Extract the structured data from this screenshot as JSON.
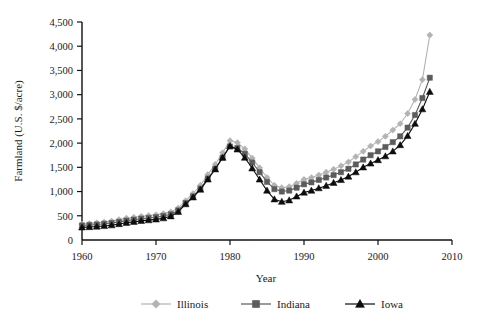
{
  "chart_data": {
    "type": "line",
    "title": "",
    "xlabel": "Year",
    "ylabel": "Farmland (U.S. $/acre)",
    "xlim": [
      1960,
      2010
    ],
    "ylim": [
      0,
      4500
    ],
    "xticks": [
      1960,
      1970,
      1980,
      1990,
      2000,
      2010
    ],
    "yticks": [
      0,
      500,
      1000,
      1500,
      2000,
      2500,
      3000,
      3500,
      4000,
      4500
    ],
    "ytick_labels": [
      "0",
      "500",
      "1,000",
      "1,500",
      "2,000",
      "2,500",
      "3,000",
      "3,500",
      "4,000",
      "4,500"
    ],
    "xtick_labels": [
      "1960",
      "1970",
      "1980",
      "1990",
      "2000",
      "2010"
    ],
    "grid": false,
    "legend_position": "bottom",
    "x": [
      1960,
      1961,
      1962,
      1963,
      1964,
      1965,
      1966,
      1967,
      1968,
      1969,
      1970,
      1971,
      1972,
      1973,
      1974,
      1975,
      1976,
      1977,
      1978,
      1979,
      1980,
      1981,
      1982,
      1983,
      1984,
      1985,
      1986,
      1987,
      1988,
      1989,
      1990,
      1991,
      1992,
      1993,
      1994,
      1995,
      1996,
      1997,
      1998,
      1999,
      2000,
      2001,
      2002,
      2003,
      2004,
      2005,
      2006,
      2007
    ],
    "series": [
      {
        "name": "Illinois",
        "color": "#b3b3b3",
        "marker": "diamond",
        "values": [
          330,
          340,
          355,
          370,
          390,
          420,
          450,
          470,
          490,
          505,
          520,
          545,
          580,
          660,
          810,
          960,
          1130,
          1350,
          1560,
          1800,
          2050,
          2010,
          1880,
          1690,
          1490,
          1290,
          1130,
          1080,
          1100,
          1170,
          1250,
          1290,
          1340,
          1400,
          1460,
          1530,
          1610,
          1720,
          1830,
          1940,
          2030,
          2140,
          2270,
          2400,
          2610,
          2900,
          3310,
          4230
        ]
      },
      {
        "name": "Indiana",
        "color": "#5c5c5c",
        "marker": "square",
        "values": [
          300,
          310,
          320,
          335,
          350,
          375,
          400,
          420,
          440,
          455,
          470,
          495,
          530,
          610,
          760,
          900,
          1060,
          1270,
          1470,
          1700,
          1930,
          1900,
          1780,
          1600,
          1400,
          1200,
          1050,
          1000,
          1020,
          1080,
          1150,
          1190,
          1240,
          1290,
          1340,
          1400,
          1470,
          1560,
          1660,
          1750,
          1830,
          1920,
          2020,
          2140,
          2320,
          2580,
          2930,
          3350
        ]
      },
      {
        "name": "Iowa",
        "color": "#0d0d0d",
        "marker": "triangle",
        "values": [
          260,
          268,
          278,
          290,
          305,
          330,
          355,
          375,
          395,
          410,
          425,
          450,
          490,
          580,
          740,
          880,
          1040,
          1250,
          1460,
          1700,
          1940,
          1870,
          1700,
          1480,
          1250,
          1020,
          840,
          790,
          820,
          900,
          980,
          1020,
          1070,
          1120,
          1180,
          1240,
          1310,
          1400,
          1500,
          1580,
          1650,
          1730,
          1830,
          1960,
          2150,
          2400,
          2700,
          3060
        ]
      }
    ]
  },
  "legend": {
    "items": [
      {
        "label": "Illinois"
      },
      {
        "label": "Indiana"
      },
      {
        "label": "Iowa"
      }
    ]
  }
}
